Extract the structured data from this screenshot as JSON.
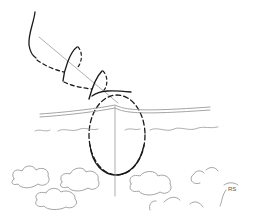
{
  "drawing": {
    "description": "Hand-drawn sketch: a swinging/tumbling object path descending toward a dashed ellipse intersecting a horizon with waves, clouds below",
    "signature": "RS",
    "colors": {
      "ink": "#1a1a1a",
      "faint": "#9a9a9a",
      "background": "#ffffff"
    }
  }
}
